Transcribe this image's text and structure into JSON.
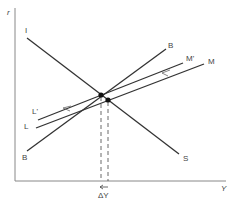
{
  "diagram": {
    "type": "IS-LM-BP shift diagram",
    "axes": {
      "y_label": "r",
      "x_label": "Y"
    },
    "curves": [
      {
        "id": "IS",
        "start_label": "I",
        "end_label": "S"
      },
      {
        "id": "BP",
        "start_label": "B",
        "end_label": "B"
      },
      {
        "id": "LM_prime",
        "start_label": "L'",
        "end_label": "M'"
      },
      {
        "id": "LM",
        "start_label": "L",
        "end_label": "M"
      }
    ],
    "annotation": {
      "delta_label": "ΔY"
    },
    "colors": {
      "line": "#333333",
      "axis": "#888888"
    }
  }
}
